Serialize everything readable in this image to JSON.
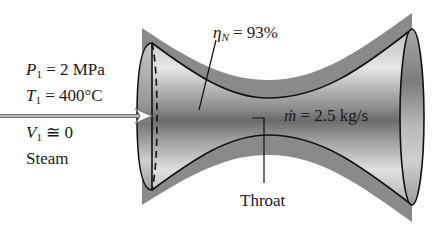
{
  "figure": {
    "type": "converging-diverging nozzle schematic",
    "inlet": {
      "pressure": {
        "symbol": "P",
        "subscript": "1",
        "value": "= 2 MPa"
      },
      "temperature": {
        "symbol": "T",
        "subscript": "1",
        "value": "= 400°C"
      },
      "velocity": {
        "symbol": "V",
        "subscript": "1",
        "value": "≅ 0"
      },
      "fluid": "Steam"
    },
    "efficiency": {
      "symbol": "η",
      "subscript": "N",
      "value": "= 93%"
    },
    "mass_flow": {
      "symbol": "ṁ",
      "value": "= 2.5 kg/s"
    },
    "throat_label": "Throat"
  },
  "colors": {
    "shell_band": "#8a8a8a",
    "interior_light": "#d8d8d8",
    "interior_dark": "#6e6e6e",
    "outline": "#111111",
    "text": "#1a1a1a"
  }
}
